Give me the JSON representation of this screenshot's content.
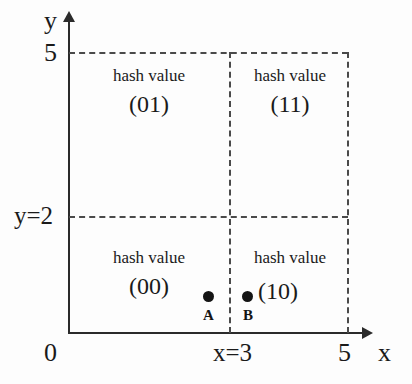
{
  "figure": {
    "type": "partition-diagram",
    "background_color": "#fdfdfd",
    "ink_color": "#1a1a1a"
  },
  "axes": {
    "y_axis_label": "y",
    "x_axis_label": "x",
    "origin_label": "0",
    "y_ticks": [
      {
        "label": "5",
        "value": 5
      },
      {
        "label": "y=2",
        "value": 2
      }
    ],
    "x_ticks": [
      {
        "label": "x=3",
        "value": 3
      },
      {
        "label": "5",
        "value": 5
      }
    ]
  },
  "quadrants": [
    {
      "id": "top-left",
      "caption": "hash value",
      "code": "(01)"
    },
    {
      "id": "top-right",
      "caption": "hash value",
      "code": "(11)"
    },
    {
      "id": "bottom-left",
      "caption": "hash value",
      "code": "(00)"
    },
    {
      "id": "bottom-right",
      "caption": "hash value",
      "code": "(10)"
    }
  ],
  "points": [
    {
      "label": "A",
      "x": 2.8,
      "y": 0.75
    },
    {
      "label": "B",
      "x": 3.5,
      "y": 0.75
    }
  ],
  "chart_data": {
    "type": "scatter",
    "title": "",
    "xlabel": "x",
    "ylabel": "y",
    "xlim": [
      0,
      5
    ],
    "ylim": [
      0,
      5
    ],
    "xticks": [
      0,
      3,
      5
    ],
    "xticklabels": [
      "0",
      "x=3",
      "5"
    ],
    "yticks": [
      2,
      5
    ],
    "yticklabels": [
      "y=2",
      "5"
    ],
    "grid": false,
    "partition_lines": {
      "vertical_x": 3,
      "horizontal_y": 2
    },
    "series": [
      {
        "name": "points",
        "points": [
          {
            "label": "A",
            "x": 2.8,
            "y": 0.75
          },
          {
            "label": "B",
            "x": 3.5,
            "y": 0.75
          }
        ]
      }
    ],
    "annotations": [
      {
        "text": "hash value (01)",
        "region": "x<3, y>2"
      },
      {
        "text": "hash value (11)",
        "region": "x>3, y>2"
      },
      {
        "text": "hash value (00)",
        "region": "x<3, y<2"
      },
      {
        "text": "hash value (10)",
        "region": "x>3, y<2"
      }
    ]
  }
}
